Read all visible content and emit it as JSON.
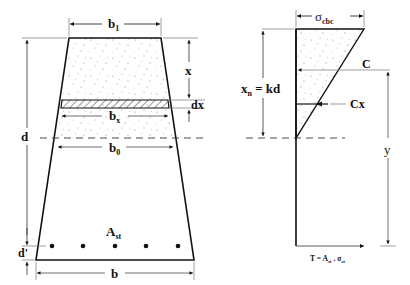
{
  "section": {
    "top_width_label": "b",
    "top_width_sub": "1",
    "depth_label": "d",
    "cover_label": "d'",
    "bottom_width_label": "b",
    "na_width_label": "b",
    "na_width_sub": "0",
    "strip_width_label": "b",
    "strip_width_sub": "x",
    "strip_distance_label": "x",
    "strip_thickness_label": "dx",
    "steel_label": "A",
    "steel_sub": "st",
    "bar_count": 5
  },
  "stress_diagram": {
    "max_stress_label": "σ",
    "max_stress_sub": "cbc",
    "na_depth_label": "x",
    "na_depth_sub": "n",
    "na_depth_eq": " = kd",
    "compression_label": "C",
    "strip_force_label": "Cx",
    "lever_arm_label": "y",
    "tension_label_main": "T = A",
    "tension_label_sub1": "st",
    "tension_label_mid": " . σ",
    "tension_label_sub2": "st"
  }
}
